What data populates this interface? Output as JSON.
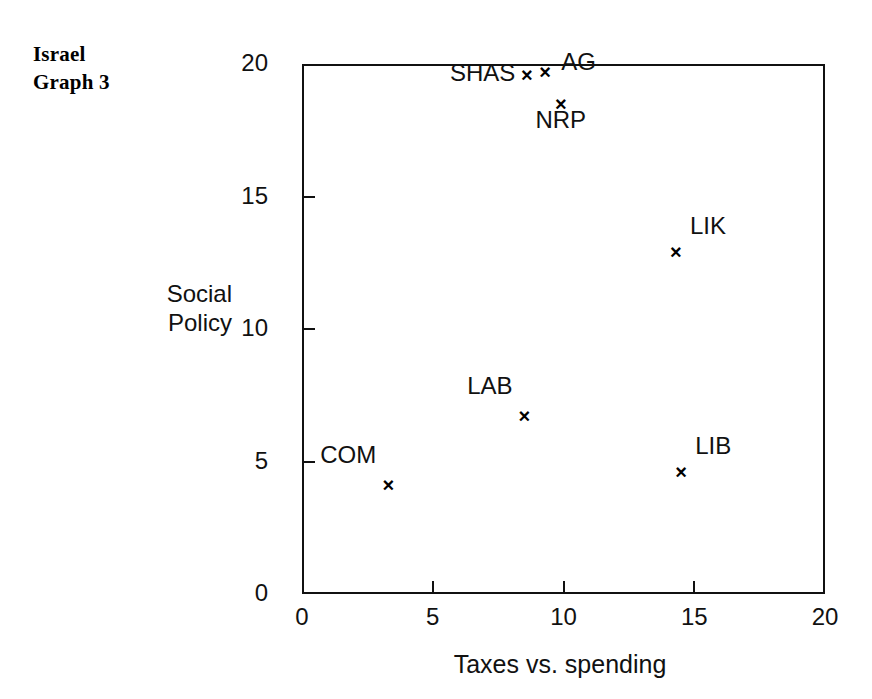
{
  "title": {
    "line1": "Israel",
    "line2": "Graph 3"
  },
  "chart_data": {
    "type": "scatter",
    "title": "Israel Graph 3",
    "xlabel": "Taxes vs. spending",
    "ylabel": "Social Policy",
    "ylabel_line1": "Social",
    "ylabel_line2": "Policy",
    "xlim": [
      0,
      20
    ],
    "ylim": [
      0,
      20
    ],
    "xticks": [
      0,
      5,
      10,
      15,
      20
    ],
    "yticks": [
      0,
      5,
      10,
      15,
      20
    ],
    "xticklabels": [
      "0",
      "5",
      "10",
      "15",
      "20"
    ],
    "yticklabels": [
      "0",
      "5",
      "10",
      "15",
      "20"
    ],
    "grid": false,
    "legend": "none",
    "marker": "x",
    "points": [
      {
        "label": "SHAS",
        "x": 8.6,
        "y": 19.6,
        "label_pos": "left"
      },
      {
        "label": "AG",
        "x": 9.3,
        "y": 19.7,
        "label_pos": "right"
      },
      {
        "label": "NRP",
        "x": 9.9,
        "y": 18.5,
        "label_pos": "below"
      },
      {
        "label": "LIK",
        "x": 14.3,
        "y": 12.9,
        "label_pos": "upper-right"
      },
      {
        "label": "LAB",
        "x": 8.5,
        "y": 6.7,
        "label_pos": "upper-left"
      },
      {
        "label": "COM",
        "x": 3.3,
        "y": 4.1,
        "label_pos": "upper-left"
      },
      {
        "label": "LIB",
        "x": 14.5,
        "y": 4.6,
        "label_pos": "upper-right"
      }
    ]
  },
  "colors": {
    "ink": "#111111",
    "background": "#ffffff"
  }
}
